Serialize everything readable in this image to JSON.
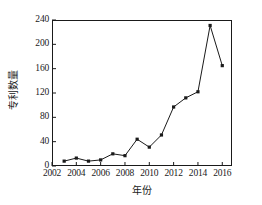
{
  "chart_data": {
    "type": "line",
    "title": "",
    "xlabel": "年份",
    "ylabel": "专利数量",
    "x": [
      2003,
      2004,
      2005,
      2006,
      2007,
      2008,
      2009,
      2010,
      2011,
      2012,
      2013,
      2014,
      2015,
      2016
    ],
    "values": [
      8,
      13,
      8,
      10,
      20,
      17,
      44,
      31,
      51,
      97,
      112,
      122,
      231,
      165
    ],
    "series": [
      {
        "name": "专利数量",
        "values": [
          8,
          13,
          8,
          10,
          20,
          17,
          44,
          31,
          51,
          97,
          112,
          122,
          231,
          165
        ]
      }
    ],
    "xlim": [
      2002,
      2016.8
    ],
    "ylim": [
      0,
      240
    ],
    "xticks": [
      2002,
      2004,
      2006,
      2008,
      2010,
      2012,
      2014,
      2016
    ],
    "xtick_labels": [
      "2002",
      "2004",
      "2006",
      "2008",
      "2010",
      "2012",
      "2014",
      "2016"
    ],
    "yticks": [
      0,
      40,
      80,
      120,
      160,
      200,
      240
    ],
    "ytick_labels": [
      "0",
      "40",
      "80",
      "120",
      "160",
      "200",
      "240"
    ],
    "grid": false,
    "legend": null,
    "marker": "square",
    "line_color": "#1a1a1a",
    "marker_color": "#1a1a1a"
  }
}
